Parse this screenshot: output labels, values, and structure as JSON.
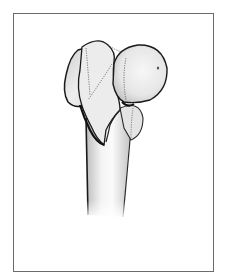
{
  "figure": {
    "frame_color": "#6a6a6a",
    "bone_fill": "#eeeeee",
    "outline_color": "#1a1a1a"
  }
}
